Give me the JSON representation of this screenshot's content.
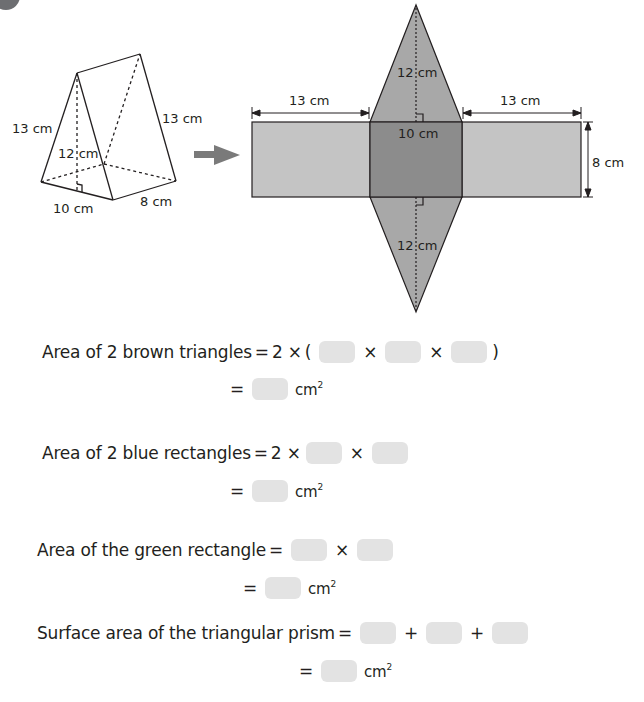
{
  "figure": {
    "prism_labels": {
      "slant_left": "13 cm",
      "slant_right": "13 cm",
      "height": "12 cm",
      "base": "10 cm",
      "length": "8 cm"
    },
    "net_labels": {
      "left_width": "13 cm",
      "right_width": "13 cm",
      "top_triangle_height": "12 cm",
      "bottom_triangle_height": "12 cm",
      "center_width": "10 cm",
      "rect_height": "8 cm"
    },
    "colors": {
      "outer_rect": "#c4c4c4",
      "center_rect": "#8c8c8c",
      "triangles": "#a8a8a8",
      "arrow": "#7a7a7a",
      "answer_box": "#e3e3e3"
    }
  },
  "equations": [
    {
      "label": "Area of 2 brown triangles",
      "line1": {
        "eq": "=",
        "prefix": "2 ×",
        "open": "(",
        "ops": [
          "×",
          "×"
        ],
        "close": ")"
      },
      "line2": {
        "eq": "=",
        "unit": "cm",
        "power": "2"
      }
    },
    {
      "label": "Area of 2 blue rectangles",
      "line1": {
        "eq": "=",
        "prefix": "2 ×",
        "ops": [
          "×"
        ]
      },
      "line2": {
        "eq": "=",
        "unit": "cm",
        "power": "2"
      }
    },
    {
      "label": "Area of the green rectangle",
      "line1": {
        "eq": "=",
        "ops": [
          "×"
        ]
      },
      "line2": {
        "eq": "=",
        "unit": "cm",
        "power": "2"
      }
    },
    {
      "label": "Surface area of the triangular prism",
      "line1": {
        "eq": "=",
        "ops": [
          "+",
          "+"
        ]
      },
      "line2": {
        "eq": "=",
        "unit": "cm",
        "power": "2"
      }
    }
  ]
}
